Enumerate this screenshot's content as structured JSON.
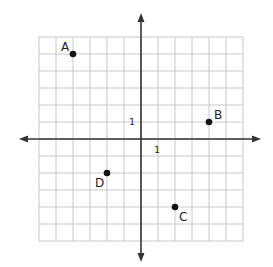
{
  "chart_data": {
    "type": "scatter",
    "title": "",
    "xlabel": "",
    "ylabel": "",
    "xlim": [
      -6,
      6
    ],
    "ylim": [
      -6,
      6
    ],
    "grid": true,
    "tick_labels": {
      "x": "1",
      "y": "1"
    },
    "points": [
      {
        "label": "A",
        "x": -4,
        "y": 5
      },
      {
        "label": "B",
        "x": 4,
        "y": 1
      },
      {
        "label": "C",
        "x": 2,
        "y": -4
      },
      {
        "label": "D",
        "x": -2,
        "y": -2
      }
    ]
  },
  "colors": {
    "grid": "#c8c8c8",
    "axis": "#333333",
    "point": "#111111",
    "text": "#222222"
  }
}
